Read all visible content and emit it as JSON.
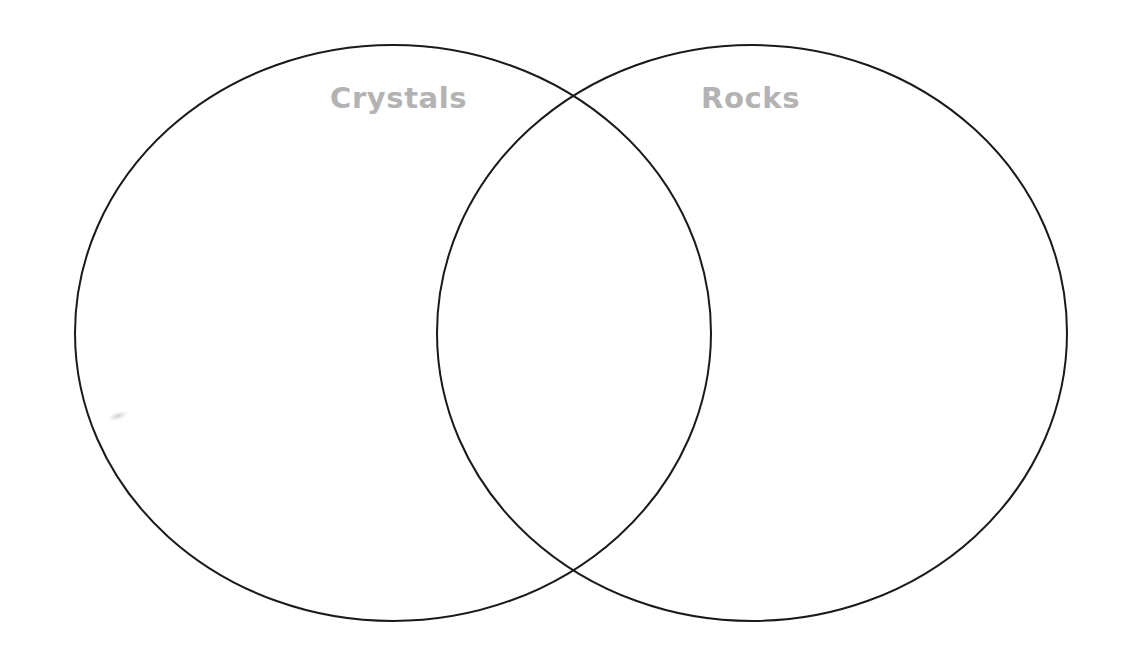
{
  "page": {
    "background_color": "#ffffff",
    "width": 1126,
    "height": 661
  },
  "diagram": {
    "type": "venn",
    "set_count": 2,
    "stroke_color": "#1a1a1a",
    "stroke_width": 2,
    "fill": "none",
    "label_color": "#b3b3b3",
    "left_circle": {
      "name": "Crystals",
      "label": "Crystals",
      "center_x": 393,
      "center_y": 333,
      "radius_x": 318,
      "radius_y": 288
    },
    "right_circle": {
      "name": "Rocks",
      "label": "Rocks",
      "center_x": 752,
      "center_y": 333,
      "radius_x": 315,
      "radius_y": 288
    },
    "intersection": {
      "label": "",
      "top_point_x": 570,
      "top_point_y": 102,
      "bottom_point_x": 572,
      "bottom_point_y": 573
    }
  },
  "labels": {
    "left": "Crystals",
    "right": "Rocks"
  },
  "marks": {
    "smudge_note": ""
  }
}
